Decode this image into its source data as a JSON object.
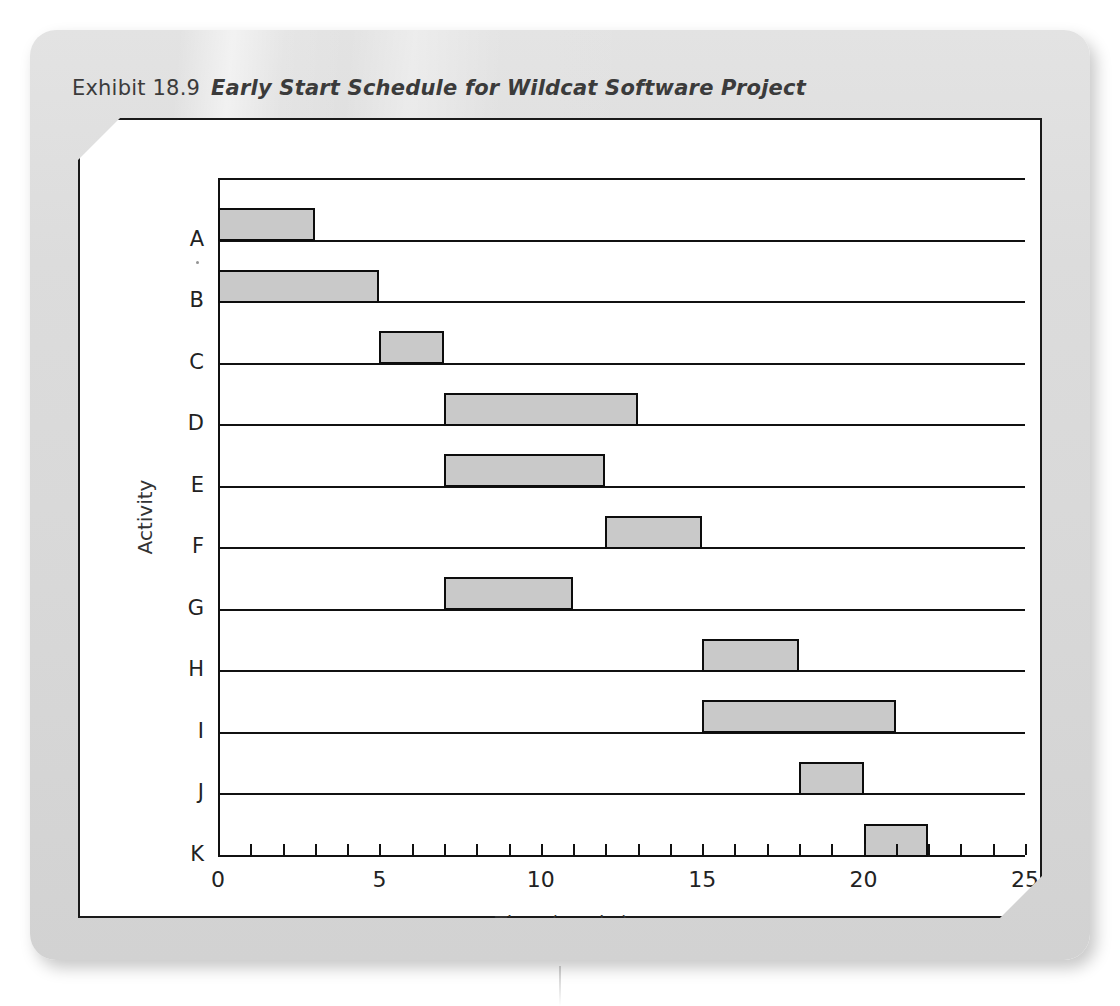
{
  "exhibit": {
    "label": "Exhibit 18.9",
    "title": "Early Start Schedule for Wildcat Software Project"
  },
  "chart_data": {
    "type": "bar",
    "orientation": "horizontal",
    "subtype": "gantt",
    "title": "Early Start Schedule for Wildcat Software Project",
    "xlabel": "Time (weeks)",
    "ylabel": "Activity",
    "xlim": [
      0,
      25
    ],
    "xticks": [
      0,
      1,
      2,
      3,
      4,
      5,
      6,
      7,
      8,
      9,
      10,
      11,
      12,
      13,
      14,
      15,
      16,
      17,
      18,
      19,
      20,
      21,
      22,
      23,
      24,
      25
    ],
    "xticklabels": [
      "0",
      "5",
      "10",
      "15",
      "20",
      "25"
    ],
    "xticklabel_values": [
      0,
      5,
      10,
      15,
      20,
      25
    ],
    "grid": false,
    "legend": null,
    "categories": [
      "A",
      "B",
      "C",
      "D",
      "E",
      "F",
      "G",
      "H",
      "I",
      "J",
      "K"
    ],
    "bars": [
      {
        "activity": "A",
        "start": 0,
        "finish": 3,
        "duration": 3
      },
      {
        "activity": "B",
        "start": 0,
        "finish": 5,
        "duration": 5
      },
      {
        "activity": "C",
        "start": 5,
        "finish": 7,
        "duration": 2
      },
      {
        "activity": "D",
        "start": 7,
        "finish": 13,
        "duration": 6
      },
      {
        "activity": "E",
        "start": 7,
        "finish": 12,
        "duration": 5
      },
      {
        "activity": "F",
        "start": 12,
        "finish": 15,
        "duration": 3
      },
      {
        "activity": "G",
        "start": 7,
        "finish": 11,
        "duration": 4
      },
      {
        "activity": "H",
        "start": 15,
        "finish": 18,
        "duration": 3
      },
      {
        "activity": "I",
        "start": 15,
        "finish": 21,
        "duration": 6
      },
      {
        "activity": "J",
        "start": 18,
        "finish": 20,
        "duration": 2
      },
      {
        "activity": "K",
        "start": 20,
        "finish": 22,
        "duration": 2
      }
    ],
    "colors": {
      "bar_fill": "#c9c9c9",
      "bar_stroke": "#0d0d0d",
      "axis": "#111111",
      "panel": "#dcdcdc",
      "figure_background": "#ffffff"
    }
  }
}
